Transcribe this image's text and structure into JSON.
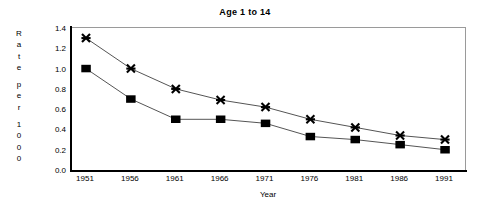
{
  "chart_data": {
    "type": "line",
    "title": "Age 1 to 14",
    "xlabel": "Year",
    "ylabel": "Rate per 1000",
    "ylabel_chars": [
      "R",
      "a",
      "t",
      "e",
      "",
      "p",
      "e",
      "r",
      "",
      "1",
      "0",
      "0",
      "0"
    ],
    "categories": [
      "1951",
      "1956",
      "1961",
      "1966",
      "1971",
      "1976",
      "1981",
      "1986",
      "1991"
    ],
    "x": [
      1951,
      1956,
      1961,
      1966,
      1971,
      1976,
      1981,
      1986,
      1991
    ],
    "series": [
      {
        "name": "series-star",
        "marker": "star",
        "values": [
          1.3,
          1.0,
          0.8,
          0.69,
          0.62,
          0.5,
          0.42,
          0.34,
          0.3
        ]
      },
      {
        "name": "series-square",
        "marker": "square",
        "values": [
          1.0,
          0.7,
          0.5,
          0.5,
          0.46,
          0.33,
          0.3,
          0.25,
          0.2
        ]
      }
    ],
    "ylim": [
      0.0,
      1.4
    ],
    "ytick_labels": [
      "0.0",
      "0.2",
      "0.4",
      "0.6",
      "0.8",
      "1.0",
      "1.2",
      "1.4"
    ],
    "ytick_values": [
      0.0,
      0.2,
      0.4,
      0.6,
      0.8,
      1.0,
      1.2,
      1.4
    ],
    "grid": false,
    "legend": "none",
    "colors": {
      "line": "#555555",
      "marker": "#000000",
      "frame": "#9a9a9a",
      "axis": "#000000",
      "background": "#ffffff"
    }
  }
}
